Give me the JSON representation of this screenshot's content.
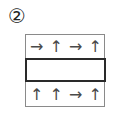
{
  "label": "②",
  "rows": {
    "top": [
      "→",
      "↑",
      "→",
      "↑"
    ],
    "bottom": [
      "↑",
      "↑",
      "→",
      "↑"
    ]
  },
  "arrow_names": {
    "→": "right-arrow-icon",
    "↑": "up-arrow-icon"
  }
}
